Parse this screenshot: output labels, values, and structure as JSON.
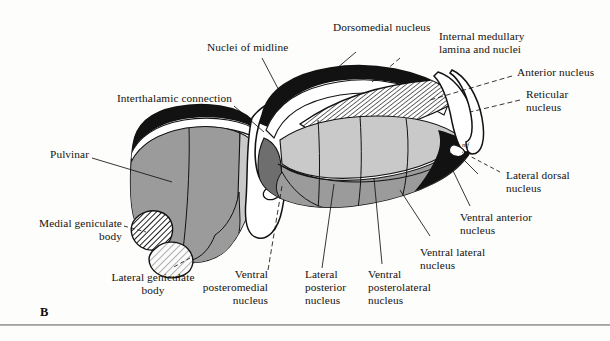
{
  "figure": {
    "panel_letter": "B"
  },
  "labels": [
    {
      "id": "nuclei-of-midline",
      "text": "Nuclei of midline"
    },
    {
      "id": "dorsomedial-nucleus",
      "text": "Dorsomedial nucleus"
    },
    {
      "id": "internal-medullary",
      "text": "Internal medullary\nlamina and nuclei"
    },
    {
      "id": "anterior-nucleus",
      "text": "Anterior nucleus"
    },
    {
      "id": "reticular-nucleus",
      "text": "Reticular\nnucleus"
    },
    {
      "id": "interthalamic-connection",
      "text": "Interthalamic connection"
    },
    {
      "id": "pulvinar",
      "text": "Pulvinar"
    },
    {
      "id": "medial-geniculate-body",
      "text": "Medial geniculate\nbody"
    },
    {
      "id": "lateral-geniculate-body",
      "text": "Lateral geniculate\nbody"
    },
    {
      "id": "ventral-posteromedial",
      "text": "Ventral\nposteromedial\nnucleus"
    },
    {
      "id": "lateral-posterior",
      "text": "Lateral\nposterior\nnucleus"
    },
    {
      "id": "ventral-posterolateral",
      "text": "Ventral\nposterolateral\nnucleus"
    },
    {
      "id": "ventral-lateral",
      "text": "Ventral lateral\nnucleus"
    },
    {
      "id": "ventral-anterior",
      "text": "Ventral anterior\nnucleus"
    },
    {
      "id": "lateral-dorsal",
      "text": "Lateral dorsal\nnucleus"
    },
    {
      "id": "mammillothalamic-mf",
      "text": "mf"
    }
  ],
  "palette": {
    "ink": "#16120f",
    "paper": "#fdfdfb",
    "black_fill": "#121212",
    "dark_gray": "#6e6e6e",
    "mid_gray": "#9b9b9b",
    "light_gray": "#c9c9c9",
    "pale_gray": "#d6d6d6",
    "white_fill": "#ffffff",
    "hatch_ink": "#2a2a2a"
  }
}
